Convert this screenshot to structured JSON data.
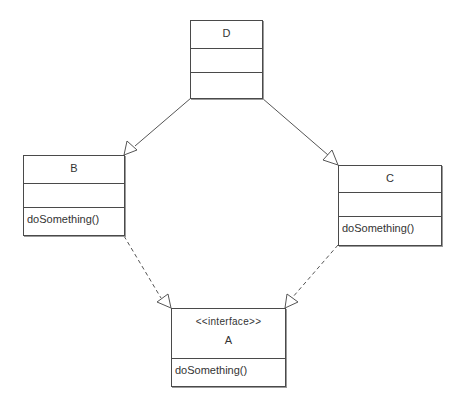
{
  "diagram": {
    "type": "uml-class-diagram",
    "colors": {
      "line": "#4a4a4a",
      "text": "#333333",
      "background": "#ffffff"
    },
    "classes": {
      "D": {
        "name": "D",
        "stereotype": null,
        "attributes": [],
        "operations": []
      },
      "B": {
        "name": "B",
        "stereotype": null,
        "attributes": [],
        "operations": [
          "doSomething()"
        ]
      },
      "C": {
        "name": "C",
        "stereotype": null,
        "attributes": [],
        "operations": [
          "doSomething()"
        ]
      },
      "A": {
        "name": "A",
        "stereotype": "<<interface>>",
        "operations": [
          "doSomething()"
        ]
      }
    },
    "relationships": [
      {
        "from": "B",
        "to": "D",
        "kind": "generalization",
        "line": "solid",
        "arrowhead": "hollow-triangle"
      },
      {
        "from": "C",
        "to": "D",
        "kind": "generalization",
        "line": "solid",
        "arrowhead": "hollow-triangle"
      },
      {
        "from": "B",
        "to": "A",
        "kind": "realization",
        "line": "dashed",
        "arrowhead": "hollow-triangle"
      },
      {
        "from": "C",
        "to": "A",
        "kind": "realization",
        "line": "dashed",
        "arrowhead": "hollow-triangle"
      }
    ]
  }
}
